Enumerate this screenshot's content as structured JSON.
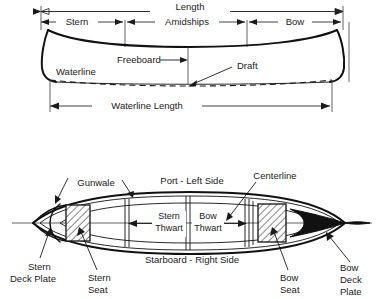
{
  "diagram": {
    "views": [
      {
        "name": "profile-view",
        "labels": {
          "length": "Length",
          "stern": "Stern",
          "amidships": "Amidships",
          "bow": "Bow",
          "freeboard": "Freeboard",
          "waterline": "Waterline",
          "draft": "Draft",
          "waterline_length": "Waterline Length"
        }
      },
      {
        "name": "plan-view",
        "labels": {
          "gunwale": "Gunwale",
          "port_left_side": "Port - Left Side",
          "centerline": "Centerline",
          "stern_thwart": "Stern\nThwart",
          "stern_thwart_line1": "Stern",
          "stern_thwart_line2": "Thwart",
          "bow_thwart_line1": "Bow",
          "bow_thwart_line2": "Thwart",
          "starboard_right_side": "Starboard - Right Side",
          "stern_deck_plate_line1": "Stern",
          "stern_deck_plate_line2": "Deck Plate",
          "stern_seat_line1": "Stern",
          "stern_seat_line2": "Seat",
          "bow_seat_line1": "Bow",
          "bow_seat_line2": "Seat",
          "bow_deck_plate_line1": "Bow",
          "bow_deck_plate_line2": "Deck",
          "bow_deck_plate_line3": "Plate"
        }
      }
    ],
    "colors": {
      "ink": "#111111",
      "line": "#2b2b2b",
      "background": "#ffffff",
      "fill_black": "#111111"
    }
  }
}
